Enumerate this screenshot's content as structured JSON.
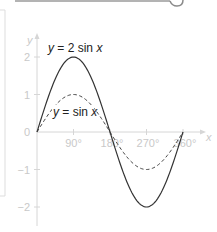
{
  "chart_data": {
    "type": "line",
    "title": "",
    "xlabel": "x",
    "ylabel": "y",
    "x_unit": "degrees",
    "xlim": [
      0,
      360
    ],
    "ylim": [
      -2,
      2
    ],
    "x_ticks": [
      90,
      180,
      270,
      360
    ],
    "x_tick_labels": [
      "90°",
      "180°",
      "270°",
      "360°"
    ],
    "y_ticks": [
      2,
      1,
      0,
      -1,
      -2
    ],
    "y_tick_labels": [
      "2",
      "1",
      "0",
      "−1",
      "−2"
    ],
    "grid": false,
    "series": [
      {
        "name": "y = 2 sin x",
        "style": "solid",
        "color": "#333333",
        "x": [
          0,
          90,
          180,
          270,
          360
        ],
        "values": [
          0,
          2,
          0,
          -2,
          0
        ]
      },
      {
        "name": "y = sin x",
        "style": "dashed",
        "color": "#444444",
        "x": [
          0,
          90,
          180,
          270,
          360
        ],
        "values": [
          0,
          1,
          0,
          -1,
          0
        ]
      }
    ],
    "annotations": [
      {
        "text": "y = 2 sin x",
        "near": "peak of y = 2 sin x"
      },
      {
        "text": "y = sin x",
        "near": "below peak of y = sin x"
      }
    ]
  },
  "labels": {
    "y_axis": "y",
    "x_axis": "x",
    "origin": "0",
    "curve1": {
      "var": "y",
      "eq": " = 2 sin",
      "arg": "x"
    },
    "curve2": {
      "var": "y",
      "eq": " = sin",
      "arg": "x"
    },
    "xticks": [
      "90°",
      "180°",
      "270°",
      "360°"
    ],
    "yticks": [
      "2",
      "1",
      "−1",
      "−2"
    ]
  },
  "colors": {
    "axis": "#d6d6d6",
    "tick_text": "#c9c9c9",
    "curve": "#333333",
    "frame": "#dddddd",
    "top_bar": "#9a9a9a"
  }
}
